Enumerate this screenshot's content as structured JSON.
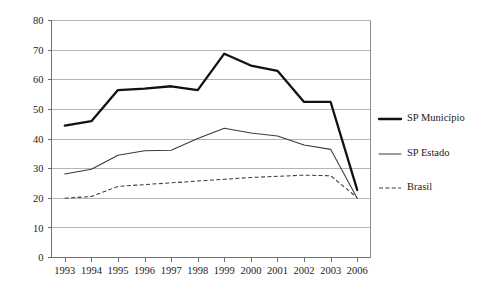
{
  "chart_data": {
    "type": "line",
    "title": "",
    "subtitle": "",
    "xlabel": "",
    "ylabel": "",
    "categories": [
      "1993",
      "1994",
      "1995",
      "1996",
      "1997",
      "1998",
      "1999",
      "2000",
      "2001",
      "2002",
      "2003",
      "2006"
    ],
    "ylim": [
      0,
      80
    ],
    "yticks": [
      0,
      10,
      20,
      30,
      40,
      50,
      60,
      70,
      80
    ],
    "grid": "horizontal",
    "legend_position": "right",
    "series": [
      {
        "name": "SP Município",
        "style": "solid-thick",
        "color": "#111111",
        "values": [
          44.5,
          46.0,
          56.5,
          57.0,
          57.8,
          56.5,
          68.8,
          64.8,
          63.0,
          52.5,
          52.5,
          22.8
        ]
      },
      {
        "name": "SP Estado",
        "style": "solid-thin",
        "color": "#3b3b3b",
        "values": [
          28.2,
          29.8,
          34.5,
          36.0,
          36.2,
          40.2,
          43.6,
          42.0,
          41.0,
          38.0,
          36.5,
          20.0
        ]
      },
      {
        "name": "Brasil",
        "style": "dashed",
        "color": "#3b3b3b",
        "values": [
          20.0,
          20.6,
          24.0,
          24.6,
          25.2,
          25.8,
          26.4,
          27.0,
          27.4,
          27.8,
          27.6,
          20.2
        ]
      }
    ]
  },
  "legend": {
    "entries": [
      {
        "label": "SP Município"
      },
      {
        "label": "SP Estado"
      },
      {
        "label": "Brasil"
      }
    ]
  }
}
